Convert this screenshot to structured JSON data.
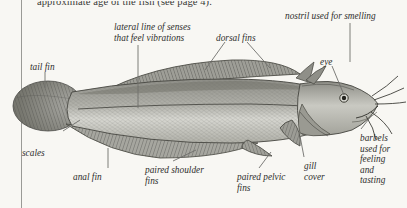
{
  "page": {
    "background_color": "#f8f7f3",
    "running_text": "approximate age of the fish (see page 4).",
    "margin_rule_color": "#9a9a96"
  },
  "figure": {
    "line_color": "#6f6f6c",
    "ink_color": "#3b3b39"
  },
  "labels": [
    {
      "id": "lateral-line",
      "text": "lateral line of senses\nthat feel vibrations",
      "x": 114,
      "y": 22
    },
    {
      "id": "dorsal-fins",
      "text": "dorsal fins",
      "x": 216,
      "y": 33
    },
    {
      "id": "nostril",
      "text": "nostril used for smelling",
      "x": 285,
      "y": 11
    },
    {
      "id": "eye",
      "text": "eye",
      "x": 320,
      "y": 57
    },
    {
      "id": "tail-fin",
      "text": "tail fin",
      "x": 30,
      "y": 62
    },
    {
      "id": "scales",
      "text": "scales",
      "x": 22,
      "y": 148
    },
    {
      "id": "anal-fin",
      "text": "anal fin",
      "x": 73,
      "y": 172
    },
    {
      "id": "shoulder-fins",
      "text": "paired shoulder\nfins",
      "x": 145,
      "y": 165
    },
    {
      "id": "pelvic-fins",
      "text": "paired pelvic\nfins",
      "x": 237,
      "y": 172
    },
    {
      "id": "gill-cover",
      "text": "gill\ncover",
      "x": 304,
      "y": 161
    },
    {
      "id": "barbels",
      "text": "barbels\nused for\nfeeling\nand\ntasting",
      "x": 360,
      "y": 133
    }
  ]
}
